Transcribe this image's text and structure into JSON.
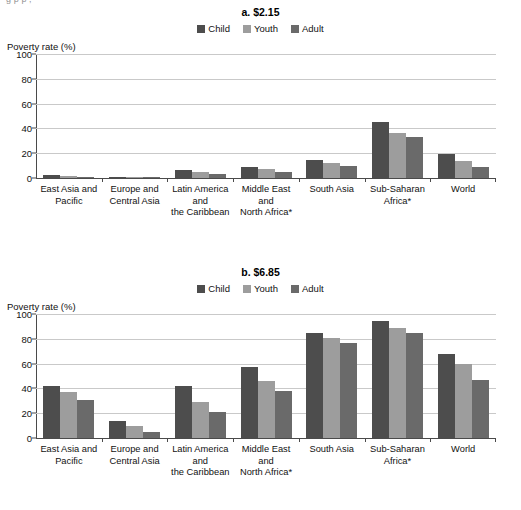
{
  "clipped_header": "g   p          p   ,",
  "series_colors": {
    "Child": "#4d4d4d",
    "Youth": "#9d9d9d",
    "Adult": "#6a6a6a"
  },
  "legend": {
    "items": [
      {
        "label": "Child",
        "color": "#4d4d4d"
      },
      {
        "label": "Youth",
        "color": "#9d9d9d"
      },
      {
        "label": "Adult",
        "color": "#6a6a6a"
      }
    ]
  },
  "panel_a": {
    "title": "a. $2.15",
    "ylabel": "Poverty rate (%)"
  },
  "panel_b": {
    "title": "b. $6.85",
    "ylabel": "Poverty rate (%)"
  },
  "yticks": [
    "100",
    "80",
    "60",
    "40",
    "20",
    "0"
  ],
  "categories": [
    "East Asia and Pacific",
    "Europe and Central Asia",
    "Latin America and the Caribbean",
    "Middle East and North Africa*",
    "South Asia",
    "Sub-Saharan Africa*",
    "World"
  ],
  "category_lines": [
    [
      "East Asia and",
      "Pacific"
    ],
    [
      "Europe and",
      "Central Asia"
    ],
    [
      "Latin America",
      "and",
      "the Caribbean"
    ],
    [
      "Middle East",
      "and",
      "North Africa*"
    ],
    [
      "South Asia"
    ],
    [
      "Sub-Saharan",
      "Africa*"
    ],
    [
      "World"
    ]
  ],
  "chart_data": [
    {
      "type": "bar",
      "title": "a. $2.15",
      "xlabel": "",
      "ylabel": "Poverty rate (%)",
      "ylim": [
        0,
        100
      ],
      "yticks": [
        0,
        20,
        40,
        60,
        80,
        100
      ],
      "grid": true,
      "legend_position": "top-center",
      "categories": [
        "East Asia and Pacific",
        "Europe and Central Asia",
        "Latin America and the Caribbean",
        "Middle East and North Africa*",
        "South Asia",
        "Sub-Saharan Africa*",
        "World"
      ],
      "series": [
        {
          "name": "Child",
          "values": [
            2.5,
            1.0,
            6.5,
            9.0,
            14.5,
            45.0,
            19.5
          ]
        },
        {
          "name": "Youth",
          "values": [
            1.8,
            0.7,
            4.5,
            7.0,
            12.0,
            36.0,
            13.5
          ]
        },
        {
          "name": "Adult",
          "values": [
            1.2,
            0.6,
            3.2,
            4.5,
            10.0,
            33.0,
            9.0
          ]
        }
      ]
    },
    {
      "type": "bar",
      "title": "b. $6.85",
      "xlabel": "",
      "ylabel": "Poverty rate (%)",
      "ylim": [
        0,
        100
      ],
      "yticks": [
        0,
        20,
        40,
        60,
        80,
        100
      ],
      "grid": true,
      "legend_position": "top-center",
      "categories": [
        "East Asia and Pacific",
        "Europe and Central Asia",
        "Latin America and the Caribbean",
        "Middle East and North Africa*",
        "South Asia",
        "Sub-Saharan Africa*",
        "World"
      ],
      "series": [
        {
          "name": "Child",
          "values": [
            42.0,
            14.0,
            42.0,
            57.0,
            85.0,
            94.0,
            68.0
          ]
        },
        {
          "name": "Youth",
          "values": [
            37.0,
            10.0,
            29.0,
            46.0,
            81.0,
            89.0,
            60.0
          ]
        },
        {
          "name": "Adult",
          "values": [
            31.0,
            5.0,
            21.0,
            38.0,
            77.0,
            85.0,
            47.0
          ]
        }
      ]
    }
  ]
}
